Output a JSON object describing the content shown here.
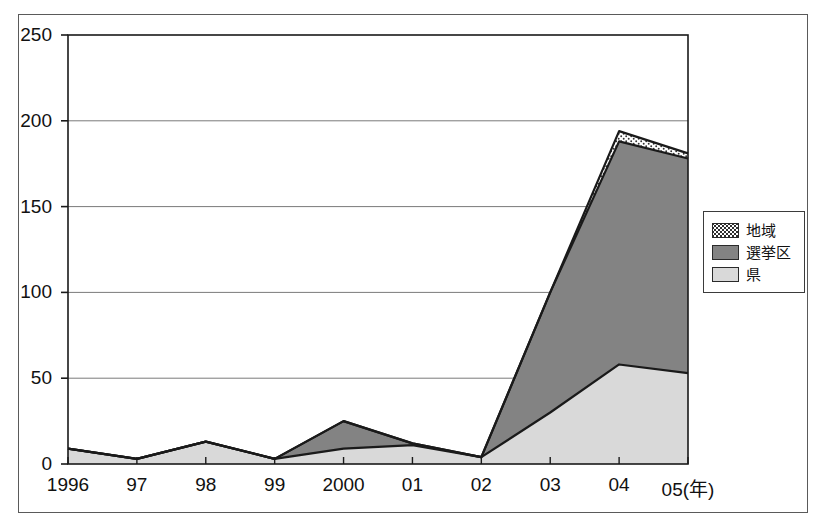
{
  "chart_data": {
    "type": "area",
    "title": "",
    "subtitle": "",
    "xlabel": "(年)",
    "ylabel": "",
    "stacked": true,
    "grid": true,
    "legend_position": "right",
    "categories": [
      "1996",
      "97",
      "98",
      "99",
      "2000",
      "01",
      "02",
      "03",
      "04",
      "05"
    ],
    "x_tick_labels": [
      "1996",
      "97",
      "98",
      "99",
      "2000",
      "01",
      "02",
      "03",
      "04",
      "05(年)"
    ],
    "y_tick_labels": [
      "0",
      "50",
      "100",
      "150",
      "200",
      "250"
    ],
    "y_ticks": [
      0,
      50,
      100,
      150,
      200,
      250
    ],
    "ylim": [
      0,
      250
    ],
    "series": [
      {
        "name": "県",
        "fill": "#d9d9d9",
        "pattern": "solid-light",
        "values": [
          9,
          3,
          13,
          3,
          9,
          11,
          4,
          30,
          58,
          53
        ]
      },
      {
        "name": "選挙区",
        "fill": "#838383",
        "pattern": "solid-dark",
        "values": [
          0,
          0,
          0,
          0,
          16,
          1,
          0,
          70,
          130,
          125
        ]
      },
      {
        "name": "地域",
        "fill": "#ffffff",
        "pattern": "dotted",
        "values": [
          0,
          0,
          0,
          0,
          0,
          0,
          0,
          0,
          6,
          3
        ]
      }
    ],
    "cumulative_totals": [
      9,
      3,
      13,
      3,
      25,
      12,
      4,
      100,
      194,
      181
    ],
    "colors": {
      "chiiki": "#ffffff",
      "senkyoku": "#838383",
      "ken": "#d9d9d9",
      "axis": "#1a1a1a",
      "grid": "#7a7a7a",
      "frame": "#5a5a5a"
    }
  },
  "legend": {
    "items": [
      {
        "label": "地域",
        "swatch": "chiiki-swatch"
      },
      {
        "label": "選挙区",
        "swatch": "senkyoku-swatch"
      },
      {
        "label": "県",
        "swatch": "ken-swatch"
      }
    ]
  }
}
